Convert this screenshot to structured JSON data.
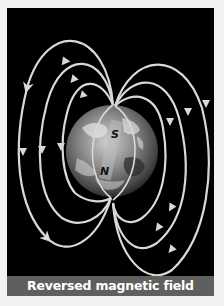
{
  "figure": {
    "caption": "Reversed magnetic field",
    "poles": {
      "top": "S",
      "bottom": "N"
    },
    "colors": {
      "background": "#000000",
      "field_lines": "#d9d9d9",
      "caption_bar": "#5f5f5f",
      "caption_text": "#ffffff"
    },
    "elements": [
      "earth-globe",
      "bar-magnet",
      "magnetic-field-lines",
      "direction-arrows"
    ]
  }
}
